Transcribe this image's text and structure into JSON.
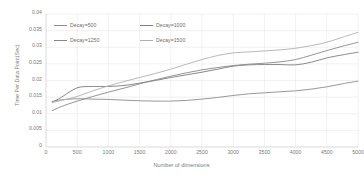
{
  "chart_data": {
    "type": "line",
    "title": "",
    "xlabel": "Number of dimensions",
    "ylabel": "Time Per Data Point(Sec)",
    "xlim": [
      0,
      5000
    ],
    "ylim": [
      0,
      0.04
    ],
    "grid": true,
    "legend_position": "top-left",
    "x_ticks": [
      "0",
      "500",
      "1000",
      "1500",
      "2000",
      "2500",
      "3000",
      "3500",
      "4000",
      "4500",
      "5000"
    ],
    "x_tick_values": [
      0,
      500,
      1000,
      1500,
      2000,
      2500,
      3000,
      3500,
      4000,
      4500,
      5000
    ],
    "y_ticks": [
      "0.04",
      "0.035",
      "0.03",
      "0.025",
      "0.02",
      "0.015",
      "0.01",
      "0.005",
      "0"
    ],
    "y_tick_values": [
      0.04,
      0.035,
      0.03,
      0.025,
      0.02,
      0.015,
      0.01,
      0.005,
      0
    ],
    "x": [
      100,
      250,
      500,
      750,
      1000,
      1250,
      1500,
      1750,
      2000,
      2250,
      2500,
      2750,
      3000,
      3250,
      3500,
      3750,
      4000,
      4250,
      4500,
      4750,
      5000
    ],
    "series": [
      {
        "name": "Decay=500",
        "color": "#8c8c8c",
        "values": [
          0.0137,
          0.0142,
          0.0145,
          0.0144,
          0.0143,
          0.0141,
          0.0139,
          0.0138,
          0.0138,
          0.014,
          0.0144,
          0.0149,
          0.0155,
          0.016,
          0.0163,
          0.0166,
          0.0169,
          0.0174,
          0.0181,
          0.019,
          0.0198
        ]
      },
      {
        "name": "Decay=1000",
        "color": "#7d7d7d",
        "values": [
          0.0134,
          0.015,
          0.0178,
          0.0182,
          0.0182,
          0.0185,
          0.0192,
          0.02,
          0.0209,
          0.0217,
          0.0225,
          0.0234,
          0.0243,
          0.0247,
          0.0248,
          0.0248,
          0.0247,
          0.0255,
          0.0268,
          0.0277,
          0.0285
        ]
      },
      {
        "name": "Decay=1250",
        "color": "#888888",
        "values": [
          0.0109,
          0.0122,
          0.0138,
          0.0152,
          0.0165,
          0.0177,
          0.019,
          0.0202,
          0.0213,
          0.0223,
          0.0232,
          0.0239,
          0.0245,
          0.0249,
          0.0252,
          0.0256,
          0.0263,
          0.0276,
          0.029,
          0.0303,
          0.0315
        ]
      },
      {
        "name": "Decay=1500",
        "color": "#b0b0b0",
        "values": [
          0.0134,
          0.014,
          0.0152,
          0.0169,
          0.0184,
          0.0197,
          0.0209,
          0.0221,
          0.0234,
          0.0249,
          0.0263,
          0.0275,
          0.0283,
          0.0286,
          0.0289,
          0.0292,
          0.0297,
          0.0305,
          0.0315,
          0.033,
          0.0345
        ]
      }
    ]
  },
  "legend": {
    "items": [
      {
        "label": "Decay=500"
      },
      {
        "label": "Decay=1000"
      },
      {
        "label": "Decay=1250"
      },
      {
        "label": "Decay=1500"
      }
    ]
  },
  "colors": {
    "grid": "#e8e8e8",
    "axis": "#d9d9d9",
    "text": "#7a7a7a",
    "background": "#ffffff"
  }
}
